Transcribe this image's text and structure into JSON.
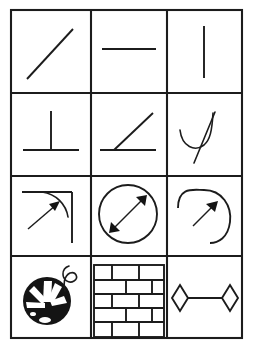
{
  "figure": {
    "background_color": "#ffffff",
    "ink_color": "#1c1c1c",
    "grid": {
      "rows": 4,
      "columns": 3,
      "border_color": "#1c1c1c",
      "left": 11,
      "top": 10,
      "right": 242,
      "bottom": 338,
      "column_dividers": [
        91,
        167
      ],
      "row_dividers": [
        93,
        176,
        256
      ]
    },
    "cells": [
      {
        "index": 1,
        "row": 1,
        "column": 1,
        "name": "oblique-line",
        "label": "Oblique line",
        "description": "A single straight line sloping upward from lower-left to upper-right"
      },
      {
        "index": 2,
        "row": 1,
        "column": 2,
        "name": "horizontal-line",
        "label": "Horizontal line",
        "description": "A single straight horizontal line placed above the cell centre"
      },
      {
        "index": 3,
        "row": 1,
        "column": 3,
        "name": "vertical-line",
        "label": "Vertical line",
        "description": "A single straight vertical line centred in the cell"
      },
      {
        "index": 4,
        "row": 2,
        "column": 1,
        "name": "perpendicular-lines",
        "label": "Perpendicular",
        "description": "Vertical segment meeting a horizontal segment at a right angle, forming a perpendicular sign"
      },
      {
        "index": 5,
        "row": 2,
        "column": 2,
        "name": "acute-angle",
        "label": "Acute angle",
        "description": "A horizontal ray and an oblique ray sharing a vertex, forming an acute angle"
      },
      {
        "index": 6,
        "row": 2,
        "column": 3,
        "name": "tangent-to-curve",
        "label": "Tangent to a curve",
        "description": "A straight line crossing a hook-shaped curve, touching it as a tangent"
      },
      {
        "index": 7,
        "row": 3,
        "column": 1,
        "name": "corner-arc-radius",
        "label": "Rounded corner arc",
        "description": "A right-angle corner with a rounded arc joining the two sides, indicated by an arrow"
      },
      {
        "index": 8,
        "row": 3,
        "column": 2,
        "name": "circle-diameter",
        "label": "Circle diameter",
        "description": "A circle with a double-headed arrow drawn across it marking the diameter"
      },
      {
        "index": 9,
        "row": 3,
        "column": 3,
        "name": "arc-radius",
        "label": "Arc radius",
        "description": "An open arc with a single-headed arrow pointing outward along the radius"
      },
      {
        "index": 10,
        "row": 4,
        "column": 1,
        "name": "ball-of-yarn",
        "label": "Ball of yarn",
        "description": "A dark filled ball with light streaks and a curling thread trailing from the top right"
      },
      {
        "index": 11,
        "row": 4,
        "column": 2,
        "name": "brick-wall",
        "label": "Brick wall",
        "description": "A wall of staggered rectangular bricks in offset courses"
      },
      {
        "index": 12,
        "row": 4,
        "column": 3,
        "name": "linked-rhombi",
        "label": "Linked rhombi",
        "description": "Two diamond shapes joined by a horizontal connecting line"
      }
    ]
  }
}
